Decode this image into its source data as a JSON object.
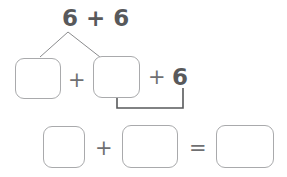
{
  "worksheet": {
    "title": "Number bond decomposition worksheet",
    "ink_color": "#58595b",
    "operator_color": "#6f7072",
    "box_border_color": "#a9aaac",
    "bracket_color": "#58595b",
    "branch_color": "#8a8b8d",
    "background": "#ffffff"
  },
  "top_expression": {
    "text": "6 + 6",
    "first_addend": "6",
    "plus": "+",
    "second_addend": "6"
  },
  "number_bond": {
    "apex_label": "6 + 6",
    "left_box": {
      "value": "",
      "placeholder": ""
    },
    "right_box": {
      "value": "",
      "placeholder": ""
    },
    "middle_plus": "+"
  },
  "regroup_row": {
    "plus": "+",
    "addend": "6",
    "bracket_label": ""
  },
  "bottom_equation": {
    "left_box": {
      "value": "",
      "placeholder": ""
    },
    "plus": "+",
    "middle_box": {
      "value": "",
      "placeholder": ""
    },
    "equals": "=",
    "result_box": {
      "value": "",
      "placeholder": ""
    }
  }
}
